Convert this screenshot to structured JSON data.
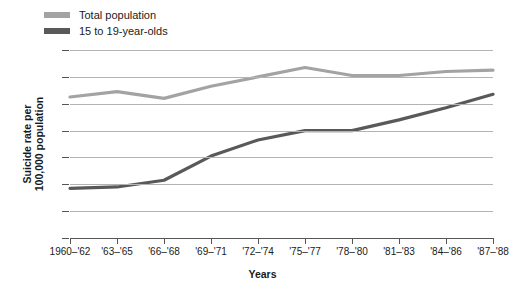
{
  "chart_data": {
    "type": "line",
    "title": "",
    "xlabel": "Years",
    "ylabel_line1": "Suicide rate per",
    "ylabel_line2": "100,000 population",
    "categories": [
      "1960–'62",
      "'63–'65",
      "'66–'68",
      "'69–'71",
      "'72–'74",
      "'75–'77",
      "'78–'80",
      "'81–'83",
      "'84–'86",
      "'87–'88"
    ],
    "ylim": [
      0,
      14
    ],
    "yticks": [
      0,
      2,
      4,
      6,
      8,
      10,
      12,
      14
    ],
    "grid": true,
    "legend_position": "top-left",
    "series": [
      {
        "name": "Total population",
        "color": "#a3a3a3",
        "values": [
          10.5,
          10.9,
          10.4,
          11.3,
          12.0,
          12.7,
          12.1,
          12.1,
          12.4,
          12.5
        ]
      },
      {
        "name": "15 to 19-year-olds",
        "color": "#595959",
        "values": [
          3.7,
          3.8,
          4.3,
          6.1,
          7.3,
          8.0,
          8.0,
          8.8,
          9.7,
          10.7
        ]
      }
    ]
  },
  "legend": {
    "items": [
      {
        "label": "Total population",
        "color": "#a3a3a3"
      },
      {
        "label": "15 to 19-year-olds",
        "color": "#595959"
      }
    ]
  }
}
